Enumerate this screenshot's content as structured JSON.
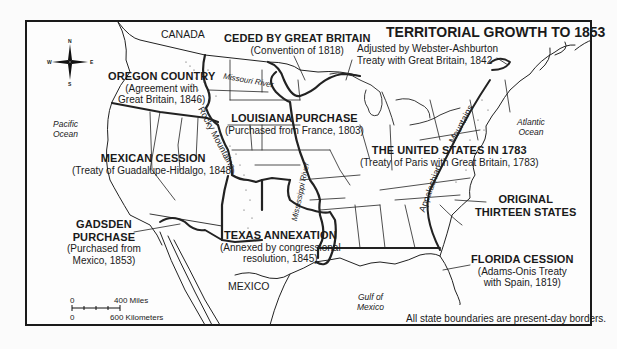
{
  "map": {
    "title": "TERRITORIAL GROWTH TO 1853",
    "footnote": "All state boundaries are present-day borders.",
    "compass": {
      "icon": "compass-rose-icon",
      "n": "N",
      "s": "S",
      "e": "E",
      "w": "W"
    },
    "scale": {
      "miles_zero": "0",
      "miles_label": "400 Miles",
      "km_zero": "0",
      "km_label": "600 Kilometers"
    },
    "regions": [
      {
        "name": "OREGON COUNTRY",
        "detail_line1": "(Agreement with",
        "detail_line2": "Great Britain, 1846)"
      },
      {
        "name": "CEDED BY GREAT BRITAIN",
        "detail_line1": "(Convention of 1818)"
      },
      {
        "name": "LOUISIANA PURCHASE",
        "detail_line1": "(Purchased from France, 1803)"
      },
      {
        "name": "MEXICAN CESSION",
        "detail_line1": "(Treaty of Guadalupe-Hidalgo, 1848)"
      },
      {
        "name_line1": "GADSDEN",
        "name_line2": "PURCHASE",
        "detail_line1": "(Purchased from",
        "detail_line2": "Mexico, 1853)"
      },
      {
        "name": "TEXAS ANNEXATION",
        "detail_line1": "(Annexed by congressional",
        "detail_line2": "resolution, 1845)"
      },
      {
        "name": "THE UNITED STATES IN 1783",
        "detail_line1": "(Treaty of Paris with Great Britain, 1783)"
      },
      {
        "name_line1": "ORIGINAL",
        "name_line2": "THIRTEEN STATES"
      },
      {
        "name": "FLORIDA CESSION",
        "detail_line1": "(Adams-Onis Treaty",
        "detail_line2": "with Spain, 1819)"
      }
    ],
    "annotations": {
      "webster_ashburton_line1": "Adjusted by Webster-Ashburton",
      "webster_ashburton_line2": "Treaty with Great Britain, 1842"
    },
    "places": {
      "canada": "CANADA",
      "mexico": "MEXICO",
      "pacific_line1": "Pacific",
      "pacific_line2": "Ocean",
      "atlantic_line1": "Atlantic",
      "atlantic_line2": "Ocean",
      "gulf_line1": "Gulf of",
      "gulf_line2": "Mexico"
    },
    "features": {
      "missouri_river": "Missouri River",
      "mississippi_river": "Mississippi River",
      "rocky_mountains": "Rocky Mountains",
      "appalachian": "Appalachian",
      "mountains": "Mountains"
    }
  }
}
